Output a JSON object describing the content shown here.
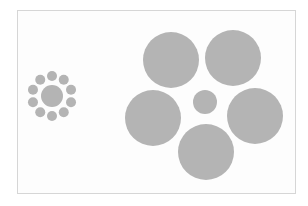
{
  "figure": {
    "title": "",
    "fill_color": "#b4b4b4",
    "frame_color": "#d6d6d6",
    "left_cluster": {
      "center": {
        "cx": 52,
        "cy": 96,
        "r": 11
      },
      "ring_radius": 20,
      "satellite_r": 5,
      "satellite_count": 10
    },
    "right_cluster": {
      "center": {
        "cx": 205,
        "cy": 102,
        "r": 12
      },
      "surrounders": [
        {
          "cx": 171,
          "cy": 60,
          "r": 28
        },
        {
          "cx": 233,
          "cy": 58,
          "r": 28
        },
        {
          "cx": 153,
          "cy": 118,
          "r": 28
        },
        {
          "cx": 255,
          "cy": 116,
          "r": 28
        },
        {
          "cx": 206,
          "cy": 152,
          "r": 28
        }
      ]
    }
  }
}
